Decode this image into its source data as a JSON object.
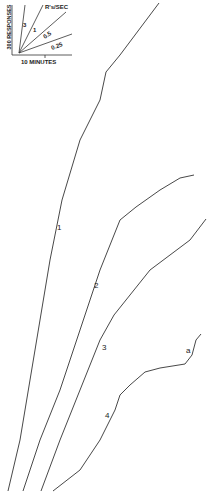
{
  "chart_data": {
    "type": "line",
    "title": "",
    "xlabel": "Time",
    "ylabel": "Cumulative responses",
    "scale": {
      "x_label": "10 MINUTES",
      "y_label": "300 RESPONSES",
      "rate_label": "R's/SEC",
      "rates": [
        "3",
        "1",
        "0.5",
        "0.25"
      ]
    },
    "series": [
      {
        "name": "1",
        "points": [
          [
            8,
            491
          ],
          [
            20,
            440
          ],
          [
            30,
            380
          ],
          [
            40,
            320
          ],
          [
            50,
            260
          ],
          [
            62,
            200
          ],
          [
            80,
            140
          ],
          [
            100,
            100
          ],
          [
            106,
            72
          ],
          [
            120,
            55
          ],
          [
            135,
            35
          ],
          [
            150,
            15
          ],
          [
            159,
            3
          ]
        ]
      },
      {
        "name": "2",
        "points": [
          [
            23,
            491
          ],
          [
            40,
            440
          ],
          [
            60,
            390
          ],
          [
            80,
            330
          ],
          [
            100,
            270
          ],
          [
            120,
            220
          ],
          [
            136,
            207
          ],
          [
            160,
            190
          ],
          [
            180,
            178
          ],
          [
            194,
            175
          ]
        ]
      },
      {
        "name": "3",
        "points": [
          [
            41,
            491
          ],
          [
            60,
            440
          ],
          [
            80,
            390
          ],
          [
            100,
            340
          ],
          [
            114,
            315
          ],
          [
            130,
            295
          ],
          [
            150,
            270
          ],
          [
            170,
            255
          ],
          [
            190,
            240
          ],
          [
            206,
            219
          ]
        ]
      },
      {
        "name": "4",
        "points": [
          [
            53,
            491
          ],
          [
            80,
            470
          ],
          [
            100,
            440
          ],
          [
            115,
            410
          ],
          [
            120,
            395
          ],
          [
            130,
            385
          ],
          [
            145,
            372
          ],
          [
            160,
            368
          ],
          [
            185,
            364
          ],
          [
            192,
            355
          ],
          [
            196,
            340
          ],
          [
            201,
            334
          ]
        ]
      }
    ],
    "annotations": [
      {
        "text": "1",
        "x": 59,
        "y": 228
      },
      {
        "text": "2",
        "x": 96,
        "y": 286
      },
      {
        "text": "3",
        "x": 104,
        "y": 348
      },
      {
        "text": "4",
        "x": 107,
        "y": 416
      },
      {
        "text": "a",
        "x": 188,
        "y": 351
      }
    ],
    "grid": false,
    "legend": "none"
  }
}
